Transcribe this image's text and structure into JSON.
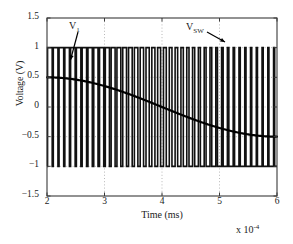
{
  "chart_data": {
    "type": "line",
    "title": "",
    "xlabel": "Time (ms)",
    "ylabel": "Voltage (V)",
    "x_exponent_label": "x 10",
    "x_exponent_value": "-4",
    "xlim": [
      2,
      6
    ],
    "ylim": [
      -1.5,
      1.5
    ],
    "xticks": [
      2,
      3,
      4,
      5,
      6
    ],
    "xtick_labels": [
      "2",
      "3",
      "4",
      "5",
      "6"
    ],
    "yticks": [
      1.5,
      1,
      0.5,
      0,
      -0.5,
      -1,
      -1.5
    ],
    "ytick_labels": [
      "1.5",
      "1",
      "0.5",
      "0",
      "-0.5",
      "-1",
      "-1.5"
    ],
    "grid": true,
    "grid_style": "dotted",
    "legend": "none",
    "annotations": [
      {
        "name": "V_1",
        "text": "V",
        "sub": "1",
        "arrow": "down-left",
        "points_to_x": 2.45,
        "points_to_y": 0.45
      },
      {
        "name": "V_SW",
        "text": "V",
        "sub": "SW",
        "arrow": "down-right",
        "points_to_x": 5.3,
        "points_to_y": 1.0
      }
    ],
    "series": [
      {
        "name": "V_SW",
        "kind": "pwm-square",
        "high": 1,
        "low": -1,
        "description": "Pulse-width-modulated switching waveform alternating between +1 V and -1 V; duty cycle decreases with the modulating signal across the window.",
        "carrier_period_ms": 0.1,
        "n_periods": 40
      },
      {
        "name": "V_1",
        "kind": "sinusoid-quarter",
        "description": "Smooth modulating signal falling from +0.5 V to -0.5 V over the window.",
        "x": [
          2.0,
          2.2,
          2.4,
          2.6,
          2.8,
          3.0,
          3.2,
          3.4,
          3.6,
          3.8,
          4.0,
          4.2,
          4.4,
          4.6,
          4.8,
          5.0,
          5.2,
          5.4,
          5.6,
          5.8,
          6.0
        ],
        "y": [
          0.5,
          0.494,
          0.476,
          0.447,
          0.405,
          0.354,
          0.294,
          0.227,
          0.155,
          0.078,
          0.0,
          -0.078,
          -0.155,
          -0.227,
          -0.294,
          -0.354,
          -0.405,
          -0.447,
          -0.476,
          -0.494,
          -0.5
        ]
      }
    ]
  }
}
